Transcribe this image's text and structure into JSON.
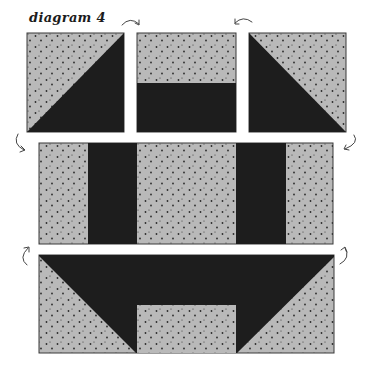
{
  "title": "diagram 4",
  "colors": {
    "light_fabric": "#b9b9b9",
    "dark_fabric": "#1d1d1d",
    "dot": "#2a2a2a",
    "outline": "#3a3a3a",
    "arrow": "#444444",
    "background": "#ffffff"
  },
  "rows": [
    {
      "name": "top-row",
      "units": [
        {
          "name": "half-square-triangle-left",
          "pattern": "light upper-left, dark lower-right"
        },
        {
          "name": "two-strip-unit",
          "pattern": "light top half, dark bottom half"
        },
        {
          "name": "half-square-triangle-right",
          "pattern": "light upper-right, dark lower-left"
        }
      ]
    },
    {
      "name": "middle-row",
      "units": [
        {
          "name": "strip-set",
          "pattern": "light | dark | light | dark | light"
        }
      ]
    },
    {
      "name": "bottom-row",
      "units": [
        {
          "name": "flying-geese-unit",
          "pattern": "dark top band with triangles, light lower corners and center rectangle"
        }
      ]
    }
  ],
  "arrows": [
    {
      "name": "rotate-arrow-top-left",
      "direction": "clockwise"
    },
    {
      "name": "rotate-arrow-top-right",
      "direction": "counterclockwise"
    },
    {
      "name": "rotate-arrow-middle-left",
      "direction": "down"
    },
    {
      "name": "rotate-arrow-middle-right",
      "direction": "down"
    },
    {
      "name": "rotate-arrow-bottom-left",
      "direction": "up"
    },
    {
      "name": "rotate-arrow-bottom-right",
      "direction": "up"
    }
  ]
}
